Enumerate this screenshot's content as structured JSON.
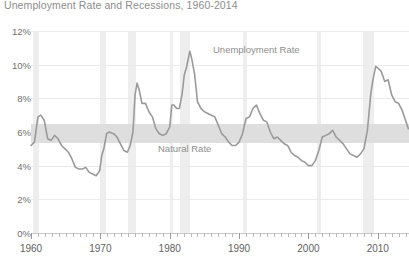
{
  "chart_data": {
    "type": "line",
    "title": "Unemployment Rate and Recessions, 1960-2014",
    "xlabel": "",
    "ylabel": "",
    "xlim": [
      1960,
      2014.5
    ],
    "ylim": [
      0,
      12
    ],
    "grid": true,
    "legend_position": "inline-annotations",
    "ytick_labels": [
      "12%",
      "10%",
      "8%",
      "6%",
      "4%",
      "2%",
      "0%"
    ],
    "ytick_values": [
      12,
      10,
      8,
      6,
      4,
      2,
      0
    ],
    "xtick_labels": [
      "1960",
      "1970",
      "1980",
      "1990",
      "2000",
      "2010"
    ],
    "xtick_values": [
      1960,
      1970,
      1980,
      1990,
      2000,
      2010
    ],
    "xtick_minor_step": 1,
    "annotations": [
      {
        "text": "Unemployment Rate",
        "x": 1983.5,
        "y": 10.7,
        "color": "#8e8e8e"
      },
      {
        "text": "Natural Rate",
        "x": 1978.0,
        "y": 5.8,
        "color": "#8e8e8e"
      }
    ],
    "bands": [
      {
        "name": "Natural Rate band",
        "y0": 5.35,
        "y1": 6.45,
        "color": "#dedede"
      }
    ],
    "recessions": [
      {
        "start": 1960.25,
        "end": 1961.17
      },
      {
        "start": 1969.92,
        "end": 1970.83
      },
      {
        "start": 1973.92,
        "end": 1975.17
      },
      {
        "start": 1980.0,
        "end": 1980.5
      },
      {
        "start": 1981.5,
        "end": 1982.92
      },
      {
        "start": 1990.5,
        "end": 1991.17
      },
      {
        "start": 2001.17,
        "end": 2001.83
      },
      {
        "start": 2007.92,
        "end": 2009.5
      }
    ],
    "recession_color": "#eeeeee",
    "series": [
      {
        "name": "Unemployment Rate",
        "color": "#9a9a9a",
        "x": [
          1960.0,
          1960.5,
          1961.0,
          1961.4,
          1961.9,
          1962.4,
          1962.9,
          1963.4,
          1963.9,
          1964.4,
          1964.9,
          1965.4,
          1965.9,
          1966.4,
          1966.9,
          1967.4,
          1967.9,
          1968.4,
          1968.9,
          1969.4,
          1969.9,
          1970.2,
          1970.5,
          1970.9,
          1971.3,
          1971.9,
          1972.4,
          1972.9,
          1973.4,
          1973.9,
          1974.3,
          1974.7,
          1975.0,
          1975.3,
          1975.6,
          1976.0,
          1976.5,
          1977.0,
          1977.5,
          1978.0,
          1978.5,
          1979.0,
          1979.5,
          1980.0,
          1980.3,
          1980.6,
          1981.0,
          1981.4,
          1981.8,
          1982.1,
          1982.4,
          1982.7,
          1982.9,
          1983.2,
          1983.6,
          1984.0,
          1984.5,
          1985.0,
          1985.5,
          1986.0,
          1986.5,
          1987.0,
          1987.5,
          1988.0,
          1988.5,
          1989.0,
          1989.5,
          1990.0,
          1990.5,
          1991.0,
          1991.5,
          1992.0,
          1992.5,
          1993.0,
          1993.5,
          1994.0,
          1994.5,
          1995.0,
          1995.5,
          1996.0,
          1996.5,
          1997.0,
          1997.5,
          1998.0,
          1998.5,
          1999.0,
          1999.5,
          2000.0,
          2000.5,
          2001.0,
          2001.5,
          2002.0,
          2002.5,
          2003.0,
          2003.5,
          2004.0,
          2004.5,
          2005.0,
          2005.5,
          2006.0,
          2006.5,
          2007.0,
          2007.5,
          2008.0,
          2008.5,
          2009.0,
          2009.3,
          2009.7,
          2010.0,
          2010.5,
          2011.0,
          2011.5,
          2012.0,
          2012.5,
          2013.0,
          2013.5,
          2014.0,
          2014.4
        ],
        "y": [
          5.2,
          5.4,
          6.9,
          7.0,
          6.7,
          5.6,
          5.5,
          5.8,
          5.6,
          5.2,
          5.0,
          4.8,
          4.4,
          3.9,
          3.8,
          3.8,
          3.9,
          3.6,
          3.5,
          3.4,
          3.7,
          4.6,
          5.0,
          5.9,
          6.0,
          5.9,
          5.7,
          5.3,
          4.9,
          4.8,
          5.2,
          6.0,
          8.2,
          8.9,
          8.5,
          7.7,
          7.7,
          7.2,
          6.9,
          6.2,
          5.9,
          5.8,
          5.9,
          6.3,
          7.6,
          7.6,
          7.4,
          7.4,
          8.3,
          9.4,
          9.8,
          10.4,
          10.8,
          10.3,
          9.4,
          7.8,
          7.4,
          7.2,
          7.1,
          7.0,
          6.9,
          6.4,
          5.9,
          5.7,
          5.4,
          5.2,
          5.2,
          5.4,
          5.9,
          6.8,
          6.9,
          7.4,
          7.6,
          7.1,
          6.7,
          6.6,
          6.0,
          5.6,
          5.7,
          5.5,
          5.3,
          5.2,
          4.8,
          4.6,
          4.5,
          4.3,
          4.2,
          4.0,
          4.0,
          4.3,
          4.9,
          5.7,
          5.8,
          5.9,
          6.1,
          5.7,
          5.5,
          5.3,
          5.0,
          4.7,
          4.6,
          4.5,
          4.7,
          5.0,
          6.1,
          8.3,
          9.1,
          9.9,
          9.8,
          9.6,
          9.0,
          9.1,
          8.2,
          7.8,
          7.7,
          7.3,
          6.7,
          6.2
        ]
      }
    ]
  },
  "labels": {
    "unemployment": "Unemployment Rate",
    "natural": "Natural Rate"
  }
}
